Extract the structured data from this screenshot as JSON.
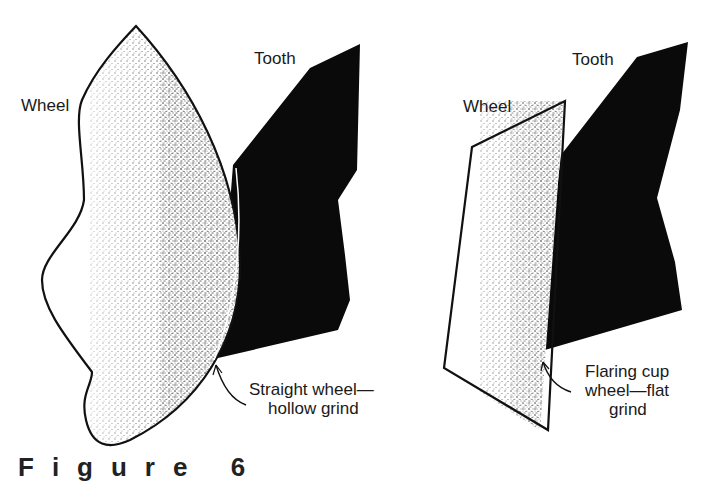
{
  "figure": {
    "left_panel": {
      "wheel_label": "Wheel",
      "tooth_label": "Tooth",
      "annotation_line1": "Straight wheel—",
      "annotation_line2": "hollow grind"
    },
    "right_panel": {
      "wheel_label": "Wheel",
      "tooth_label": "Tooth",
      "annotation_line1": "Flaring cup",
      "annotation_line2": "wheel—flat",
      "annotation_line3": "grind"
    },
    "caption_partial": "Figure  6"
  },
  "colors": {
    "tooth": "#0a0a0a",
    "outline": "#111111",
    "stipple": "#333333",
    "background": "#ffffff"
  }
}
